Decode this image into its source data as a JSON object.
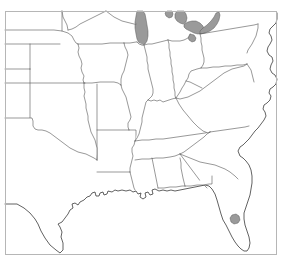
{
  "figure": {
    "kind": "map",
    "background_color": "#ffffff"
  },
  "frame": {
    "name": "map-border",
    "x": 5,
    "y": 11,
    "width": 272,
    "height": 244,
    "stroke_color": "#b6b6b6",
    "stroke_width": 1
  },
  "style": {
    "land_fill": "#ffffff",
    "state_border_color": "#545454",
    "coast_border_color": "#2e2e2e",
    "water_fill": "#9a9a9a",
    "water_border_color": "#5a5a5a"
  },
  "water_bodies": [
    {
      "name": "lake-michigan",
      "label": "Lake Michigan",
      "fill": "#9a9a9a"
    },
    {
      "name": "lake-huron",
      "label": "Lake Huron",
      "fill": "#9a9a9a"
    },
    {
      "name": "lake-erie",
      "label": "Lake Erie",
      "fill": "#9a9a9a"
    },
    {
      "name": "lake-st-clair",
      "label": "Lake St. Clair",
      "fill": "#9a9a9a"
    },
    {
      "name": "georgian-bay",
      "label": "Georgian Bay",
      "fill": "#9a9a9a"
    },
    {
      "name": "lake-okeechobee",
      "label": "Lake Okeechobee",
      "fill": "#9a9a9a"
    }
  ],
  "regions": [
    {
      "name": "colorado",
      "label": "Colorado"
    },
    {
      "name": "new-mexico",
      "label": "New Mexico"
    },
    {
      "name": "nebraska",
      "label": "Nebraska"
    },
    {
      "name": "kansas",
      "label": "Kansas"
    },
    {
      "name": "oklahoma",
      "label": "Oklahoma"
    },
    {
      "name": "texas",
      "label": "Texas"
    },
    {
      "name": "south-dakota",
      "label": "South Dakota"
    },
    {
      "name": "iowa",
      "label": "Iowa"
    },
    {
      "name": "missouri",
      "label": "Missouri"
    },
    {
      "name": "arkansas",
      "label": "Arkansas"
    },
    {
      "name": "louisiana",
      "label": "Louisiana"
    },
    {
      "name": "minnesota",
      "label": "Minnesota"
    },
    {
      "name": "wisconsin",
      "label": "Wisconsin"
    },
    {
      "name": "illinois",
      "label": "Illinois"
    },
    {
      "name": "michigan",
      "label": "Michigan"
    },
    {
      "name": "indiana",
      "label": "Indiana"
    },
    {
      "name": "ohio",
      "label": "Ohio"
    },
    {
      "name": "kentucky",
      "label": "Kentucky"
    },
    {
      "name": "tennessee",
      "label": "Tennessee"
    },
    {
      "name": "mississippi",
      "label": "Mississippi"
    },
    {
      "name": "alabama",
      "label": "Alabama"
    },
    {
      "name": "georgia",
      "label": "Georgia"
    },
    {
      "name": "florida",
      "label": "Florida"
    },
    {
      "name": "south-carolina",
      "label": "South Carolina"
    },
    {
      "name": "north-carolina",
      "label": "North Carolina"
    },
    {
      "name": "virginia",
      "label": "Virginia"
    },
    {
      "name": "west-virginia",
      "label": "West Virginia"
    },
    {
      "name": "maryland",
      "label": "Maryland"
    },
    {
      "name": "delaware",
      "label": "Delaware"
    },
    {
      "name": "pennsylvania",
      "label": "Pennsylvania"
    },
    {
      "name": "new-jersey",
      "label": "New Jersey"
    },
    {
      "name": "new-york",
      "label": "New York"
    }
  ]
}
